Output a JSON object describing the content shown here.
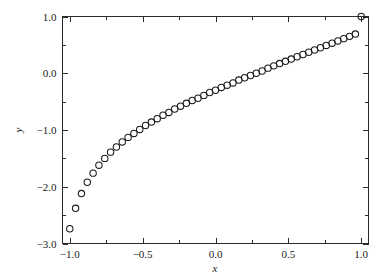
{
  "chart_data": {
    "type": "scatter",
    "title": "",
    "xlabel": "x",
    "ylabel": "y",
    "xlim": [
      -1.05,
      1.05
    ],
    "ylim": [
      -3.0,
      1.0
    ],
    "grid": false,
    "legend": null,
    "marker_style": "open-circle",
    "marker_color": "#1a1a1a",
    "marker_size_px": 6.4,
    "xticks": [
      -1.0,
      -0.5,
      0.0,
      0.5,
      1.0
    ],
    "xtick_labels": [
      "-1.0",
      "-0.5",
      "0.0",
      "0.5",
      "1.0"
    ],
    "xticks_minor": [
      -0.75,
      -0.25,
      0.25,
      0.75
    ],
    "yticks": [
      -3.0,
      -2.0,
      -1.0,
      0.0,
      1.0
    ],
    "ytick_labels": [
      "-3.0",
      "-2.0",
      "-1.0",
      "0.0",
      "1.0"
    ],
    "yticks_minor": [
      -2.5,
      -1.5,
      -0.5,
      0.5
    ],
    "series": [
      {
        "name": "data",
        "x": [
          -1.0,
          -0.96,
          -0.92,
          -0.88,
          -0.84,
          -0.8,
          -0.76,
          -0.72,
          -0.68,
          -0.64,
          -0.6,
          -0.56,
          -0.52,
          -0.48,
          -0.44,
          -0.4,
          -0.36,
          -0.32,
          -0.28,
          -0.24,
          -0.2,
          -0.16,
          -0.12,
          -0.08,
          -0.04,
          0.0,
          0.04,
          0.08,
          0.12,
          0.16,
          0.2,
          0.24,
          0.28,
          0.32,
          0.36,
          0.4,
          0.44,
          0.48,
          0.52,
          0.56,
          0.6,
          0.64,
          0.68,
          0.72,
          0.76,
          0.8,
          0.84,
          0.88,
          0.92,
          0.96,
          1.0
        ],
        "y": [
          -2.74,
          -2.38,
          -2.12,
          -1.92,
          -1.76,
          -1.62,
          -1.5,
          -1.39,
          -1.3,
          -1.21,
          -1.13,
          -1.06,
          -0.99,
          -0.92,
          -0.86,
          -0.8,
          -0.74,
          -0.69,
          -0.63,
          -0.58,
          -0.53,
          -0.48,
          -0.44,
          -0.39,
          -0.34,
          -0.3,
          -0.25,
          -0.21,
          -0.17,
          -0.12,
          -0.08,
          -0.04,
          0.0,
          0.04,
          0.09,
          0.13,
          0.17,
          0.21,
          0.25,
          0.29,
          0.33,
          0.37,
          0.41,
          0.45,
          0.49,
          0.53,
          0.57,
          0.61,
          0.65,
          0.69,
          1.0
        ]
      }
    ]
  },
  "axis_titles": {
    "x": "x",
    "y": "y"
  }
}
